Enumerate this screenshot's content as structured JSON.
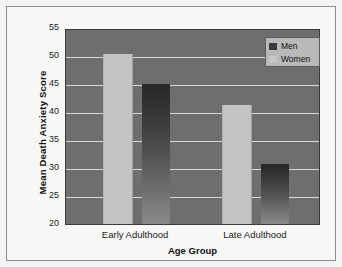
{
  "chart_data": {
    "type": "bar",
    "title": "",
    "xlabel": "Age Group",
    "ylabel": "Mean Death Anxiety Score",
    "categories": [
      "Early Adulthood",
      "Late Adulthood"
    ],
    "series": [
      {
        "name": "Men",
        "values": [
          45.0,
          30.7
        ],
        "color": "#3a3a3a"
      },
      {
        "name": "Women",
        "values": [
          50.3,
          41.2
        ],
        "color": "#c3c3c1"
      }
    ],
    "ylim": [
      20,
      55
    ],
    "yticks": [
      20,
      25,
      30,
      35,
      40,
      45,
      50,
      55
    ],
    "ytick_labels": [
      "20",
      "25",
      "30",
      "35",
      "40",
      "45",
      "50",
      "55"
    ],
    "grid": true,
    "grid_color": "#d8d8d6",
    "legend_position": "top-right",
    "legend_entries": [
      "Men",
      "Women"
    ],
    "plot_background": "#6e6e6e",
    "figure_background": "#f7f7f5"
  }
}
